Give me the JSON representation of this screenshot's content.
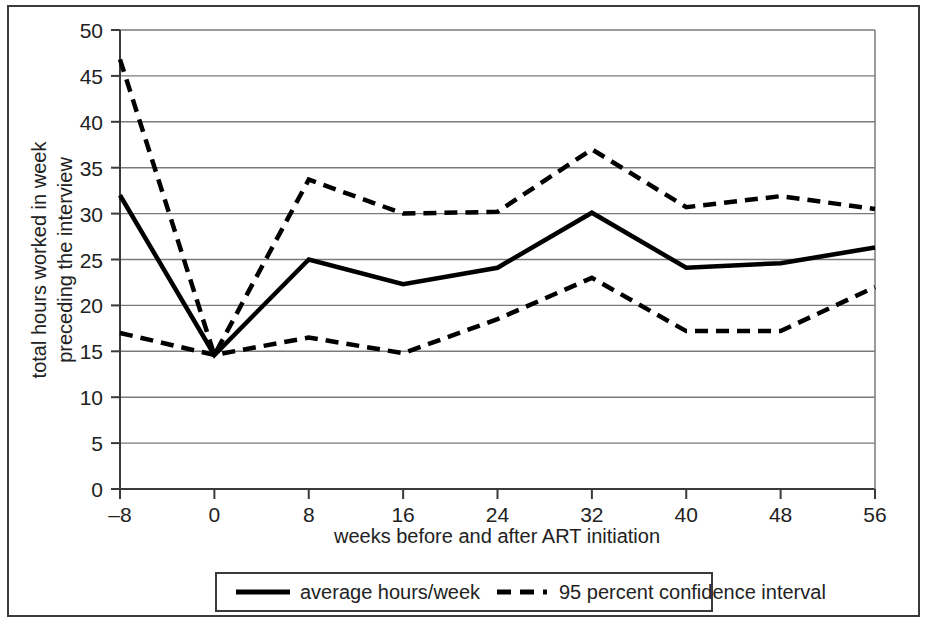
{
  "chart_data": {
    "type": "line",
    "title": "",
    "xlabel": "weeks before and after ART initiation",
    "ylabel": "total hours worked in week preceding the interview",
    "ylabel_lines": [
      "total hours worked in week",
      "preceding the interview"
    ],
    "x": [
      -8,
      0,
      8,
      16,
      24,
      32,
      40,
      48,
      56
    ],
    "xticklabels": [
      "–8",
      "0",
      "8",
      "16",
      "24",
      "32",
      "40",
      "48",
      "56"
    ],
    "yticklabels": [
      "0",
      "5",
      "10",
      "15",
      "20",
      "25",
      "30",
      "35",
      "40",
      "45",
      "50"
    ],
    "yticks": [
      0,
      5,
      10,
      15,
      20,
      25,
      30,
      35,
      40,
      45,
      50
    ],
    "xlim": [
      -8,
      56
    ],
    "ylim": [
      0,
      50
    ],
    "grid": "horizontal",
    "legend_position": "bottom",
    "series": [
      {
        "name": "average hours/week",
        "style": "solid",
        "color": "#000000",
        "values": [
          32.0,
          14.6,
          25.0,
          22.3,
          24.1,
          30.1,
          24.1,
          24.6,
          26.3
        ]
      },
      {
        "name": "95 percent confidence interval upper",
        "style": "dashed",
        "color": "#000000",
        "values": [
          46.8,
          14.6,
          33.7,
          30.0,
          30.2,
          37.0,
          30.7,
          31.9,
          30.5
        ]
      },
      {
        "name": "95 percent confidence interval lower",
        "style": "dashed",
        "color": "#000000",
        "values": [
          17.0,
          14.6,
          16.5,
          14.8,
          18.5,
          23.0,
          17.2,
          17.2,
          22.0
        ]
      }
    ]
  },
  "legend": {
    "items": [
      {
        "label": "average hours/week",
        "style": "solid"
      },
      {
        "label": "95 percent confidence interval",
        "style": "dashed"
      }
    ]
  },
  "axes": {
    "x_title": "weeks before and after ART initiation",
    "y_title_line1": "total hours worked in week",
    "y_title_line2": "preceding the interview"
  },
  "colors": {
    "line": "#000000",
    "grid": "#7a7a7a",
    "axis": "#3a3a3a",
    "frame": "#3a3a3a",
    "text": "#222222",
    "background": "#ffffff"
  }
}
